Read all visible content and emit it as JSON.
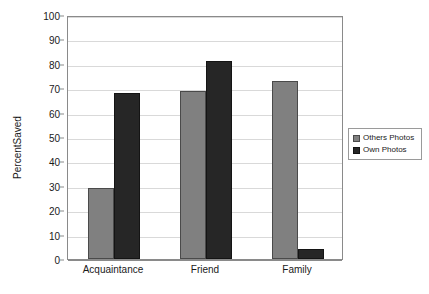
{
  "chart_data": {
    "type": "bar",
    "title": "",
    "subtitle": "",
    "xlabel": "",
    "ylabel": "PercentSaved",
    "categories": [
      "Acquaintance",
      "Friend",
      "Family"
    ],
    "series": [
      {
        "name": "Others Photos",
        "color": "#808080",
        "values": [
          29,
          69,
          73
        ]
      },
      {
        "name": "Own Photos",
        "color": "#262626",
        "values": [
          68,
          81,
          4
        ]
      }
    ],
    "ylim": [
      0,
      100
    ],
    "y_ticks": [
      0,
      10,
      20,
      30,
      40,
      50,
      60,
      70,
      80,
      90,
      100
    ],
    "y_tick_labels": [
      "0",
      "10",
      "20",
      "30",
      "40",
      "50",
      "60",
      "70",
      "80",
      "90",
      "100"
    ],
    "grid": true,
    "grid_axis": "y",
    "legend_position": "right",
    "legend_entries": [
      "Others Photos",
      "Own Photos"
    ],
    "annotations": [],
    "plot_background": "#ffffff",
    "frame_color": "#8a8a8a",
    "gridline_color": "#d9d9d9"
  }
}
